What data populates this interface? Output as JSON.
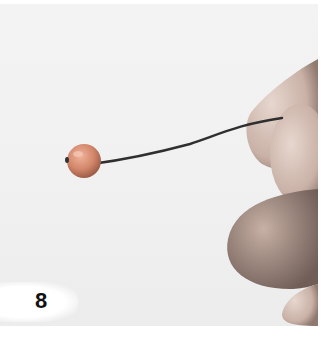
{
  "image": {
    "description": "Photo of a hand holding a headpin wire with a round bead threaded on it, wire slightly bent",
    "step_number": "8",
    "colors": {
      "background": "#f1f1f1",
      "bead": "#d88a6e",
      "wire": "#3a3a3a",
      "skin": "#d8c3b8"
    }
  }
}
